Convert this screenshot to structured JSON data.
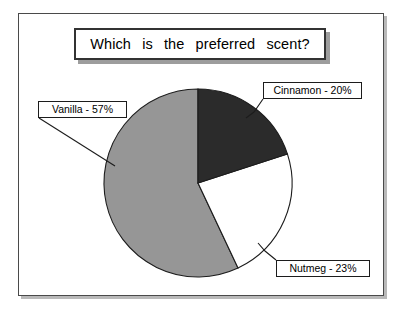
{
  "figure": {
    "title": "Which is the preferred scent?"
  },
  "chart_data": {
    "type": "pie",
    "title": "Which is the preferred scent?",
    "xlabel": "",
    "ylabel": "",
    "legend_position": "callout-labels",
    "grid": false,
    "categories": [
      "Cinnamon",
      "Nutmeg",
      "Vanilla"
    ],
    "values": [
      20,
      23,
      57
    ],
    "units": "percent",
    "start_angle_deg": 0,
    "direction": "clockwise",
    "slices": [
      {
        "label": "Cinnamon - 20%",
        "name": "Cinnamon",
        "value": 20,
        "color": "#2b2b2b",
        "start_deg": 0,
        "end_deg": 72
      },
      {
        "label": "Nutmeg - 23%",
        "name": "Nutmeg",
        "value": 23,
        "color": "#ffffff",
        "start_deg": 72,
        "end_deg": 154.8
      },
      {
        "label": "Vanilla - 57%",
        "name": "Vanilla",
        "value": 57,
        "color": "#969696",
        "start_deg": 154.8,
        "end_deg": 360
      }
    ]
  },
  "labels": {
    "cinnamon": "Cinnamon - 20%",
    "nutmeg": "Nutmeg - 23%",
    "vanilla": "Vanilla - 57%"
  },
  "colors": {
    "cinnamon_slice": "#2b2b2b",
    "nutmeg_slice": "#ffffff",
    "vanilla_slice": "#969696",
    "outline": "#1c1c1c",
    "frame": "#4a4a4a",
    "shadow": "#9d9d9d",
    "background": "#ffffff"
  }
}
